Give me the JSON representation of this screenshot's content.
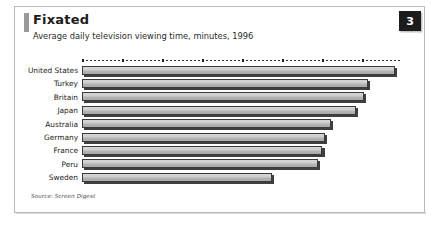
{
  "card": {
    "title": "Fixated",
    "subtitle": "Average daily television viewing time, minutes, 1996",
    "badge": "3",
    "source": "Source: Screen Digest",
    "accent_color": "#9a9a9a",
    "badge_bg": "#1c1c1c",
    "badge_fg": "#ffffff",
    "bar_fill": "#c9c9c9",
    "bar_outline": "#3a3a3a",
    "bar_shadow": "#3f3f3f",
    "frame_color": "#b9b9b9"
  },
  "chart_data": {
    "type": "bar",
    "orientation": "horizontal",
    "title": "Fixated",
    "subtitle": "Average daily television viewing time, minutes, 1996",
    "xlabel": "",
    "ylabel": "",
    "grid": false,
    "legend": "none",
    "axis_style": "dotted-top",
    "xlim": [
      0,
      260
    ],
    "categories": [
      "United States",
      "Turkey",
      "Britain",
      "Japan",
      "Australia",
      "Germany",
      "France",
      "Peru",
      "Sweden"
    ],
    "values": [
      255,
      233,
      230,
      223,
      203,
      198,
      196,
      192,
      155
    ],
    "units": "minutes per day",
    "source": "Screen Digest"
  }
}
